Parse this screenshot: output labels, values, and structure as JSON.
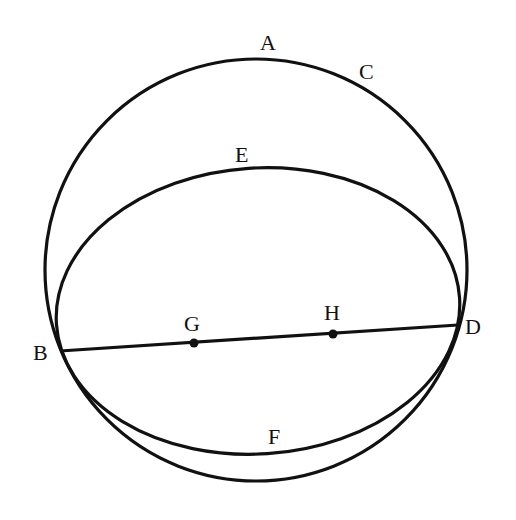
{
  "diagram": {
    "type": "geometry",
    "stroke_color": "#111111",
    "background": "#ffffff",
    "circle": {
      "cx": 256,
      "cy": 270,
      "r": 211
    },
    "ellipse": {
      "cx": 258,
      "cy": 311,
      "rx": 202,
      "ry": 143,
      "rotation": -3.8
    },
    "segment_BD": {
      "x1": 60,
      "y1": 351,
      "x2": 458,
      "y2": 325
    },
    "points": [
      {
        "id": "G",
        "x": 194,
        "y": 343
      },
      {
        "id": "H",
        "x": 333,
        "y": 334
      }
    ],
    "labels": {
      "A": "A",
      "B": "B",
      "C": "C",
      "D": "D",
      "E": "E",
      "F": "F",
      "G": "G",
      "H": "H"
    }
  }
}
